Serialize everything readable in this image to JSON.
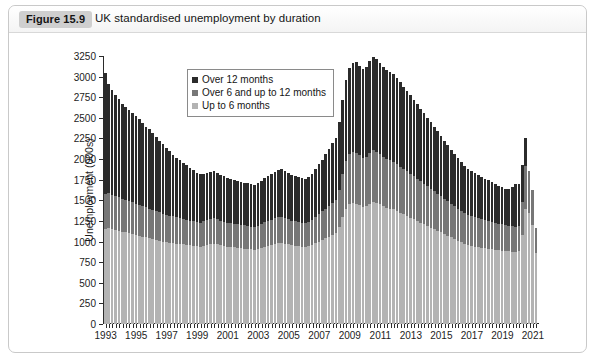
{
  "figure": {
    "badge": "Figure 15.9",
    "title": "UK standardised unemployment by duration"
  },
  "chart_data": {
    "type": "bar",
    "subtype": "stacked-bar",
    "title": "UK standardised unemployment by duration",
    "xlabel": "",
    "ylabel": "Unemployment (000s)",
    "ylim": [
      0,
      3250
    ],
    "ytick_step": 250,
    "yticks": [
      0,
      250,
      500,
      750,
      1000,
      1250,
      1500,
      1750,
      2000,
      2250,
      2500,
      2750,
      3000,
      3250
    ],
    "grid": false,
    "legend_position": "top-left-inside",
    "xtick_labels": [
      "1993",
      "1995",
      "1997",
      "1999",
      "2001",
      "2003",
      "2005",
      "2007",
      "2009",
      "2011",
      "2013",
      "2015",
      "2017",
      "2019",
      "2021"
    ],
    "x_range": [
      "1993",
      "2021"
    ],
    "x_interval": "quarterly",
    "series": [
      {
        "name": "Up to 6 months",
        "color": "#b3b3b3",
        "stack_order": 1,
        "values": [
          1150,
          1170,
          1150,
          1140,
          1130,
          1120,
          1110,
          1100,
          1090,
          1080,
          1070,
          1060,
          1050,
          1040,
          1030,
          1020,
          1010,
          1000,
          990,
          985,
          980,
          975,
          970,
          965,
          960,
          955,
          950,
          945,
          940,
          950,
          960,
          970,
          975,
          965,
          955,
          945,
          940,
          935,
          930,
          925,
          920,
          915,
          910,
          905,
          900,
          910,
          925,
          940,
          950,
          960,
          970,
          980,
          985,
          975,
          965,
          955,
          950,
          945,
          940,
          935,
          945,
          960,
          980,
          1000,
          1020,
          1040,
          1060,
          1080,
          1100,
          1180,
          1300,
          1400,
          1450,
          1470,
          1460,
          1440,
          1420,
          1430,
          1460,
          1480,
          1470,
          1450,
          1430,
          1410,
          1400,
          1390,
          1370,
          1350,
          1330,
          1310,
          1290,
          1270,
          1250,
          1230,
          1210,
          1190,
          1170,
          1150,
          1130,
          1110,
          1090,
          1070,
          1050,
          1030,
          1010,
          990,
          975,
          960,
          950,
          940,
          930,
          925,
          920,
          915,
          905,
          900,
          895,
          890,
          885,
          880,
          875,
          870,
          880,
          1080,
          1400,
          1350,
          1200,
          860
        ]
      },
      {
        "name": "Over 6 and up to 12 months",
        "color": "#777777",
        "stack_order": 2,
        "values": [
          430,
          420,
          415,
          410,
          405,
          400,
          395,
          390,
          385,
          380,
          375,
          370,
          365,
          360,
          355,
          350,
          345,
          340,
          335,
          330,
          325,
          320,
          315,
          310,
          305,
          300,
          295,
          290,
          290,
          295,
          300,
          305,
          310,
          305,
          300,
          295,
          290,
          288,
          286,
          284,
          282,
          280,
          278,
          276,
          274,
          280,
          288,
          296,
          300,
          305,
          310,
          315,
          318,
          312,
          306,
          300,
          296,
          292,
          288,
          285,
          290,
          300,
          315,
          330,
          345,
          360,
          375,
          390,
          405,
          450,
          520,
          580,
          610,
          620,
          615,
          605,
          595,
          600,
          615,
          625,
          620,
          610,
          600,
          590,
          585,
          580,
          570,
          560,
          550,
          540,
          530,
          520,
          510,
          500,
          490,
          480,
          470,
          460,
          450,
          440,
          430,
          420,
          410,
          400,
          390,
          380,
          372,
          365,
          360,
          355,
          350,
          346,
          342,
          338,
          332,
          328,
          324,
          320,
          316,
          312,
          308,
          304,
          310,
          400,
          520,
          500,
          420,
          300
        ]
      },
      {
        "name": "Over 12 months",
        "color": "#2b2b2b",
        "stack_order": 3,
        "values": [
          1470,
          1320,
          1270,
          1230,
          1190,
          1150,
          1130,
          1110,
          1080,
          1060,
          1040,
          1010,
          980,
          960,
          930,
          900,
          870,
          840,
          810,
          780,
          750,
          720,
          700,
          680,
          660,
          640,
          620,
          600,
          590,
          580,
          575,
          570,
          565,
          560,
          555,
          550,
          545,
          540,
          535,
          530,
          525,
          520,
          518,
          516,
          514,
          518,
          525,
          535,
          545,
          555,
          565,
          575,
          580,
          572,
          564,
          556,
          550,
          545,
          540,
          536,
          545,
          560,
          580,
          605,
          630,
          660,
          690,
          720,
          750,
          820,
          900,
          980,
          1040,
          1080,
          1100,
          1090,
          1080,
          1090,
          1110,
          1130,
          1120,
          1105,
          1090,
          1080,
          1070,
          1060,
          1040,
          1020,
          1000,
          980,
          955,
          930,
          905,
          880,
          855,
          830,
          805,
          780,
          755,
          730,
          705,
          680,
          655,
          630,
          610,
          590,
          575,
          560,
          548,
          536,
          524,
          512,
          500,
          490,
          480,
          470,
          460,
          450,
          440,
          445,
          480,
          530,
          510,
          450,
          330
        ]
      }
    ],
    "notable_points": {
      "start_1993_total": 3050,
      "trough_2004_total": 1430,
      "peak_2011_total": 2700,
      "end_2021_spike_total": 1780
    }
  },
  "legend": {
    "items": [
      {
        "label": "Over 12 months",
        "color": "#2b2b2b"
      },
      {
        "label": "Over 6 and up to 12 months",
        "color": "#777777"
      },
      {
        "label": "Up to 6 months",
        "color": "#b3b3b3"
      }
    ]
  }
}
